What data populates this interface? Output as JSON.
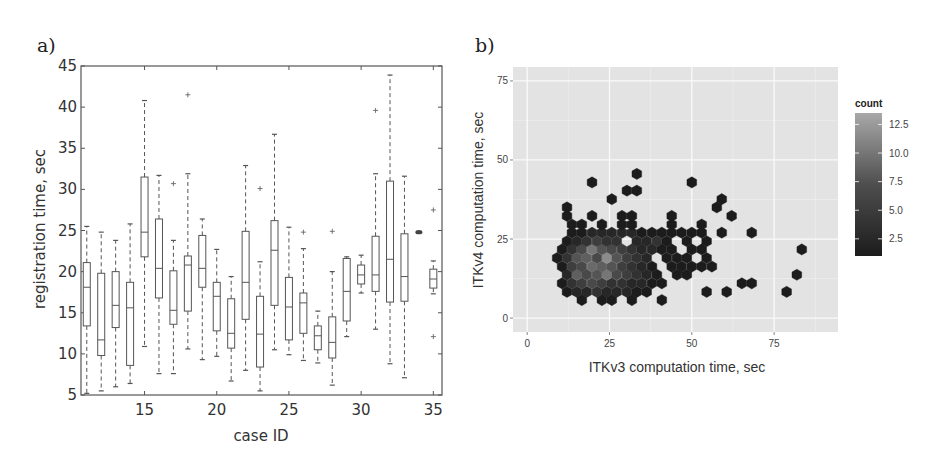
{
  "figure": {
    "panel_a_label": "a)",
    "panel_b_label": "b)"
  },
  "chart_data": [
    {
      "type": "box",
      "title": "",
      "panel": "a)",
      "xlabel": "case ID",
      "ylabel": "registration time, sec",
      "xlim": [
        10.6,
        35.6
      ],
      "ylim": [
        5,
        45
      ],
      "xticks": [
        15,
        20,
        25,
        30,
        35
      ],
      "yticks": [
        5,
        10,
        15,
        20,
        25,
        30,
        35,
        40,
        45
      ],
      "grid": false,
      "boxes": [
        {
          "case": 11,
          "whislo": 5.2,
          "q1": 13.4,
          "med": 18.1,
          "q3": 21.1,
          "whishi": 25.5,
          "fliers": []
        },
        {
          "case": 12,
          "whislo": 5.5,
          "q1": 9.8,
          "med": 11.7,
          "q3": 19.8,
          "whishi": 24.8,
          "fliers": []
        },
        {
          "case": 13,
          "whislo": 6.0,
          "q1": 13.2,
          "med": 15.9,
          "q3": 20.0,
          "whishi": 23.8,
          "fliers": []
        },
        {
          "case": 14,
          "whislo": 6.4,
          "q1": 8.6,
          "med": 15.6,
          "q3": 18.7,
          "whishi": 25.8,
          "fliers": []
        },
        {
          "case": 15,
          "whislo": 10.9,
          "q1": 21.8,
          "med": 24.8,
          "q3": 31.5,
          "whishi": 40.8,
          "fliers": []
        },
        {
          "case": 16,
          "whislo": 7.6,
          "q1": 16.8,
          "med": 20.4,
          "q3": 26.4,
          "whishi": 31.7,
          "fliers": []
        },
        {
          "case": 17,
          "whislo": 7.6,
          "q1": 13.6,
          "med": 15.3,
          "q3": 20.1,
          "whishi": 23.8,
          "fliers": [
            30.7
          ]
        },
        {
          "case": 18,
          "whislo": 10.6,
          "q1": 15.2,
          "med": 20.8,
          "q3": 21.9,
          "whishi": 31.9,
          "fliers": [
            41.5
          ]
        },
        {
          "case": 19,
          "whislo": 9.3,
          "q1": 18.1,
          "med": 20.4,
          "q3": 24.4,
          "whishi": 26.4,
          "fliers": []
        },
        {
          "case": 20,
          "whislo": 9.7,
          "q1": 12.8,
          "med": 17.0,
          "q3": 18.7,
          "whishi": 22.7,
          "fliers": []
        },
        {
          "case": 21,
          "whislo": 6.7,
          "q1": 10.7,
          "med": 12.5,
          "q3": 16.7,
          "whishi": 19.4,
          "fliers": []
        },
        {
          "case": 22,
          "whislo": 8.0,
          "q1": 14.2,
          "med": 18.7,
          "q3": 24.9,
          "whishi": 32.9,
          "fliers": []
        },
        {
          "case": 23,
          "whislo": 5.5,
          "q1": 8.4,
          "med": 12.4,
          "q3": 17.0,
          "whishi": 21.2,
          "fliers": [
            30.1
          ]
        },
        {
          "case": 24,
          "whislo": 10.5,
          "q1": 15.9,
          "med": 22.6,
          "q3": 26.2,
          "whishi": 36.7,
          "fliers": []
        },
        {
          "case": 25,
          "whislo": 9.9,
          "q1": 11.7,
          "med": 15.7,
          "q3": 19.3,
          "whishi": 25.4,
          "fliers": []
        },
        {
          "case": 26,
          "whislo": 9.2,
          "q1": 12.5,
          "med": 16.2,
          "q3": 17.4,
          "whishi": 22.8,
          "fliers": [
            24.8
          ]
        },
        {
          "case": 27,
          "whislo": 8.9,
          "q1": 10.5,
          "med": 12.2,
          "q3": 13.4,
          "whishi": 15.2,
          "fliers": []
        },
        {
          "case": 28,
          "whislo": 6.2,
          "q1": 9.5,
          "med": 11.4,
          "q3": 14.5,
          "whishi": 20.0,
          "fliers": [
            24.9
          ]
        },
        {
          "case": 29,
          "whislo": 12.1,
          "q1": 14.0,
          "med": 17.6,
          "q3": 21.6,
          "whishi": 21.8,
          "fliers": []
        },
        {
          "case": 30,
          "whislo": 17.4,
          "q1": 18.5,
          "med": 19.6,
          "q3": 20.8,
          "whishi": 22.0,
          "fliers": []
        },
        {
          "case": 31,
          "whislo": 13.0,
          "q1": 17.6,
          "med": 19.6,
          "q3": 24.3,
          "whishi": 31.9,
          "fliers": [
            39.6
          ]
        },
        {
          "case": 32,
          "whislo": 8.8,
          "q1": 16.3,
          "med": 21.5,
          "q3": 31.0,
          "whishi": 43.9,
          "fliers": []
        },
        {
          "case": 33,
          "whislo": 7.1,
          "q1": 16.4,
          "med": 19.4,
          "q3": 24.6,
          "whishi": 31.6,
          "fliers": []
        },
        {
          "case": 34,
          "whislo": 24.8,
          "q1": 24.8,
          "med": 24.8,
          "q3": 24.8,
          "whishi": 24.8,
          "fliers": [],
          "degenerate": true
        },
        {
          "case": 35,
          "whislo": 17.3,
          "q1": 18.0,
          "med": 19.1,
          "q3": 20.3,
          "whishi": 21.3,
          "fliers": [
            27.5,
            12.1
          ]
        }
      ]
    },
    {
      "type": "heatmap",
      "subtype": "hexbin",
      "panel": "b)",
      "title": "",
      "xlabel": "ITKv3 computation time, sec",
      "ylabel": "ITKv4 computation time, sec",
      "xlim": [
        -4.3,
        94.4
      ],
      "ylim": [
        -4.4,
        79.4
      ],
      "xticks": [
        0,
        25,
        50,
        75
      ],
      "yticks": [
        0,
        25,
        50,
        75
      ],
      "grid": true,
      "legend": {
        "title": "count",
        "position": "right",
        "ticks": [
          "2.5",
          "5.0",
          "7.5",
          "10.0",
          "12.5"
        ],
        "range": [
          1,
          13.5
        ]
      },
      "cell_size_x": 3.04,
      "cells_note": "[x, y, count] hex centers",
      "cells": [
        [
          16.6,
          5.7,
          1
        ],
        [
          22.7,
          5.7,
          1
        ],
        [
          25.7,
          5.7,
          1
        ],
        [
          31.8,
          5.7,
          1
        ],
        [
          40.9,
          5.7,
          1
        ],
        [
          12.1,
          8.3,
          1
        ],
        [
          15.1,
          8.3,
          2
        ],
        [
          18.1,
          8.3,
          2
        ],
        [
          21.2,
          8.3,
          3
        ],
        [
          24.2,
          8.3,
          2
        ],
        [
          27.2,
          8.3,
          2
        ],
        [
          30.3,
          8.3,
          2
        ],
        [
          33.3,
          8.3,
          1
        ],
        [
          36.3,
          8.3,
          1
        ],
        [
          54.5,
          8.3,
          1
        ],
        [
          60.6,
          8.3,
          1
        ],
        [
          78.8,
          8.3,
          1
        ],
        [
          10.6,
          11.0,
          1
        ],
        [
          13.6,
          11.0,
          3
        ],
        [
          16.6,
          11.0,
          4
        ],
        [
          19.7,
          11.0,
          5
        ],
        [
          22.7,
          11.0,
          4
        ],
        [
          25.7,
          11.0,
          3
        ],
        [
          28.8,
          11.0,
          3
        ],
        [
          31.8,
          11.0,
          2
        ],
        [
          34.8,
          11.0,
          2
        ],
        [
          37.9,
          11.0,
          1
        ],
        [
          40.9,
          11.0,
          1
        ],
        [
          65.2,
          11.0,
          1
        ],
        [
          68.2,
          11.0,
          1
        ],
        [
          12.1,
          13.7,
          2
        ],
        [
          15.1,
          13.7,
          7
        ],
        [
          18.1,
          13.7,
          5
        ],
        [
          21.2,
          13.7,
          6
        ],
        [
          24.2,
          13.7,
          9
        ],
        [
          27.2,
          13.7,
          5
        ],
        [
          30.3,
          13.7,
          4
        ],
        [
          33.3,
          13.7,
          3
        ],
        [
          36.3,
          13.7,
          2
        ],
        [
          39.4,
          13.7,
          1
        ],
        [
          45.5,
          13.7,
          1
        ],
        [
          48.5,
          13.7,
          1
        ],
        [
          81.9,
          13.7,
          1
        ],
        [
          10.6,
          16.3,
          1
        ],
        [
          13.6,
          16.3,
          4
        ],
        [
          16.6,
          16.3,
          5
        ],
        [
          19.7,
          16.3,
          8
        ],
        [
          22.7,
          16.3,
          7
        ],
        [
          25.7,
          16.3,
          6
        ],
        [
          28.8,
          16.3,
          4
        ],
        [
          31.8,
          16.3,
          3
        ],
        [
          34.8,
          16.3,
          2
        ],
        [
          37.9,
          16.3,
          1
        ],
        [
          43.9,
          16.3,
          1
        ],
        [
          46.9,
          16.3,
          1
        ],
        [
          50.0,
          16.3,
          1
        ],
        [
          53.0,
          16.3,
          1
        ],
        [
          56.1,
          16.3,
          1
        ],
        [
          9.1,
          19.0,
          1
        ],
        [
          12.1,
          19.0,
          3
        ],
        [
          15.1,
          19.0,
          6
        ],
        [
          18.1,
          19.0,
          7
        ],
        [
          21.2,
          19.0,
          5
        ],
        [
          24.2,
          19.0,
          11
        ],
        [
          27.2,
          19.0,
          6
        ],
        [
          30.3,
          19.0,
          4
        ],
        [
          33.3,
          19.0,
          3
        ],
        [
          36.3,
          19.0,
          2
        ],
        [
          42.4,
          19.0,
          1
        ],
        [
          45.5,
          19.0,
          1
        ],
        [
          48.5,
          19.0,
          1
        ],
        [
          54.5,
          19.0,
          1
        ],
        [
          10.6,
          21.7,
          1
        ],
        [
          13.6,
          21.7,
          3
        ],
        [
          16.6,
          21.7,
          5
        ],
        [
          19.7,
          21.7,
          9
        ],
        [
          22.7,
          21.7,
          6
        ],
        [
          25.7,
          21.7,
          5
        ],
        [
          28.8,
          21.7,
          4
        ],
        [
          31.8,
          21.7,
          3
        ],
        [
          34.8,
          21.7,
          2
        ],
        [
          37.9,
          21.7,
          2
        ],
        [
          40.9,
          21.7,
          1
        ],
        [
          43.9,
          21.7,
          1
        ],
        [
          50.0,
          21.7,
          1
        ],
        [
          53.0,
          21.7,
          1
        ],
        [
          83.4,
          21.7,
          1
        ],
        [
          12.1,
          24.3,
          1
        ],
        [
          15.1,
          24.3,
          2
        ],
        [
          18.1,
          24.3,
          3
        ],
        [
          21.2,
          24.3,
          4
        ],
        [
          24.2,
          24.3,
          3
        ],
        [
          27.2,
          24.3,
          3
        ],
        [
          33.3,
          24.3,
          2
        ],
        [
          36.3,
          24.3,
          2
        ],
        [
          39.4,
          24.3,
          3
        ],
        [
          42.4,
          24.3,
          1
        ],
        [
          48.5,
          24.3,
          1
        ],
        [
          54.5,
          24.3,
          1
        ],
        [
          13.6,
          27.0,
          1
        ],
        [
          16.6,
          27.0,
          1
        ],
        [
          19.7,
          27.0,
          2
        ],
        [
          22.7,
          27.0,
          2
        ],
        [
          25.7,
          27.0,
          2
        ],
        [
          28.8,
          27.0,
          2
        ],
        [
          31.8,
          27.0,
          2
        ],
        [
          34.8,
          27.0,
          1
        ],
        [
          37.9,
          27.0,
          1
        ],
        [
          40.9,
          27.0,
          1
        ],
        [
          43.9,
          27.0,
          1
        ],
        [
          46.9,
          27.0,
          1
        ],
        [
          50.0,
          27.0,
          1
        ],
        [
          53.0,
          27.0,
          1
        ],
        [
          59.1,
          27.0,
          1
        ],
        [
          68.2,
          27.0,
          1
        ],
        [
          13.6,
          29.6,
          1
        ],
        [
          16.6,
          29.6,
          1
        ],
        [
          22.7,
          29.6,
          1
        ],
        [
          28.8,
          29.6,
          1
        ],
        [
          31.8,
          29.6,
          1
        ],
        [
          43.9,
          29.6,
          1
        ],
        [
          53.0,
          29.6,
          1
        ],
        [
          12.1,
          32.3,
          1
        ],
        [
          19.7,
          32.3,
          1
        ],
        [
          28.8,
          32.3,
          1
        ],
        [
          31.8,
          32.3,
          1
        ],
        [
          43.9,
          32.3,
          1
        ],
        [
          62.1,
          32.3,
          1
        ],
        [
          12.1,
          35.0,
          1
        ],
        [
          57.6,
          35.0,
          1
        ],
        [
          25.7,
          37.6,
          1
        ],
        [
          59.1,
          37.6,
          1
        ],
        [
          30.3,
          40.3,
          1
        ],
        [
          33.3,
          40.3,
          1
        ],
        [
          19.7,
          42.9,
          1
        ],
        [
          50.0,
          42.9,
          1
        ],
        [
          33.3,
          45.6,
          1
        ]
      ]
    }
  ]
}
